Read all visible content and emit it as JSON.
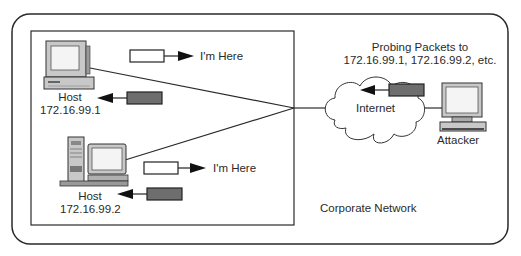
{
  "diagram": {
    "outer_label": "Corporate Network",
    "hosts": [
      {
        "name": "Host",
        "ip": "172.16.99.1",
        "reply_label": "I'm Here"
      },
      {
        "name": "Host",
        "ip": "172.16.99.2",
        "reply_label": "I'm Here"
      }
    ],
    "internet_label": "Internet",
    "attacker_label": "Attacker",
    "probe_label_line1": "Probing Packets to",
    "probe_label_line2": "172.16.99.1, 172.16.99.2, etc.",
    "colors": {
      "line": "#222222",
      "packet_probe": "#6e6e6e",
      "packet_reply": "#ffffff",
      "device_body": "#c8c8c8",
      "screen": "#f4f4f4"
    }
  }
}
